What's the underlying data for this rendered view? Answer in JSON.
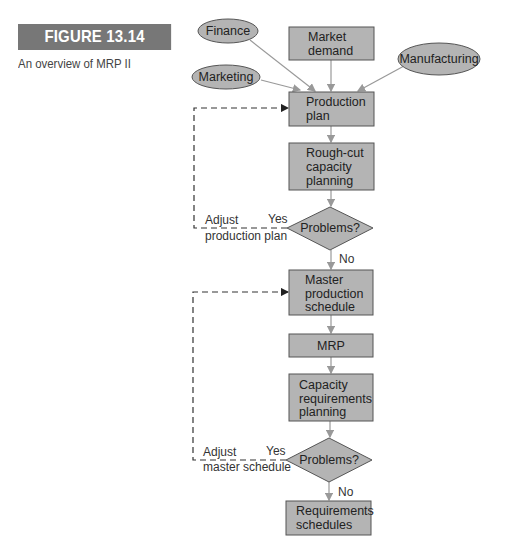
{
  "figure": {
    "label": "FIGURE 13.14",
    "caption": "An overview of MRP II"
  },
  "diagram": {
    "inputs": {
      "finance": "Finance",
      "marketing": "Marketing",
      "manufacturing": "Manufacturing",
      "market_demand": [
        "Market",
        "demand"
      ]
    },
    "steps": {
      "production_plan": [
        "Production",
        "plan"
      ],
      "rough_cut": [
        "Rough-cut",
        "capacity",
        "planning"
      ],
      "decision1": "Problems?",
      "master_schedule": [
        "Master",
        "production",
        "schedule"
      ],
      "mrp": "MRP",
      "capacity_req": [
        "Capacity",
        "requirements",
        "planning"
      ],
      "decision2": "Problems?",
      "requirements": [
        "Requirements",
        "schedules"
      ]
    },
    "edges": {
      "yes": "Yes",
      "no": "No",
      "adjust1": [
        "Adjust",
        "production plan"
      ],
      "adjust2": [
        "Adjust",
        "master schedule"
      ]
    },
    "colors": {
      "node_fill": "#b4b4b4",
      "node_stroke": "#555555",
      "arrow": "#999999",
      "feedback": "#333333",
      "label_bar": "#777777"
    }
  }
}
